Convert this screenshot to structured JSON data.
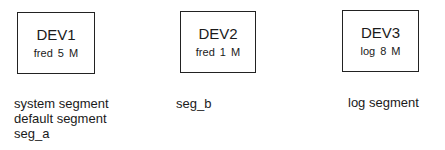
{
  "devices": [
    {
      "name": "DEV1",
      "info": "fred  5 M",
      "segments": [
        "system segment",
        "default segment",
        "seg_a"
      ]
    },
    {
      "name": "DEV2",
      "info": "fred 1 M",
      "segments": [
        "seg_b"
      ]
    },
    {
      "name": "DEV3",
      "info": "log  8 M",
      "segments": [
        "log segment"
      ]
    }
  ]
}
